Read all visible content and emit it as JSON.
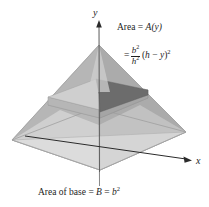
{
  "figure": {
    "background_color": "#ffffff"
  },
  "axes": {
    "y_label": "y",
    "x_label": "x",
    "color": "#2b2b2b"
  },
  "annotations": {
    "area_label": "Area = A(y)",
    "area_text": "Area =",
    "area_function": "A",
    "area_arg": "(y)",
    "formula_equals": "=",
    "formula_numerator_base": "b",
    "formula_numerator_exp": "2",
    "formula_denominator_base": "h",
    "formula_denominator_exp": "2",
    "formula_tail_open": "(",
    "formula_tail_h": "h",
    "formula_tail_minus": " − ",
    "formula_tail_y": "y",
    "formula_tail_close": ")",
    "formula_tail_exp": "2",
    "base_label": "Area of base = B = b²",
    "base_text": "Area of base =",
    "base_B": "B",
    "base_equals2": "=",
    "base_b": "b",
    "base_b_exp": "2"
  },
  "colors": {
    "background": "#ffffff",
    "face_left_upper": "#a9a9a9",
    "face_right_upper": "#b2b2b2",
    "face_front_light": "#e9e9e9",
    "face_left_lower": "#bdbdbd",
    "face_right_lower": "#c9c9c9",
    "base_plane": "#dcdcdc",
    "slab_top": "#c5c5c5",
    "slab_dark_edge": "#6c6c6c",
    "slab_front": "#b0b0b0",
    "axis": "#2b2b2b",
    "text": "#1d1d1d",
    "outline": "#9a9a9a"
  },
  "geometry": {
    "apex": [
      99,
      45
    ],
    "base_left": [
      12,
      140
    ],
    "base_right": [
      186,
      132
    ],
    "base_front": [
      100,
      170
    ],
    "base_back": [
      95,
      108
    ],
    "slab_y_top": 93,
    "slab_y_bottom": 105
  }
}
